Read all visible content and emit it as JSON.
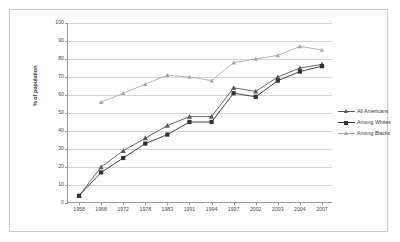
{
  "chart_data": {
    "type": "line",
    "title": "",
    "xlabel": "",
    "ylabel": "% of population",
    "ylim": [
      0,
      100
    ],
    "ytick_values": [
      0,
      10,
      20,
      30,
      40,
      50,
      60,
      70,
      80,
      90,
      100
    ],
    "grid": true,
    "legend_position": "right",
    "categories": [
      "1958",
      "1968",
      "1972",
      "1978",
      "1983",
      "1991",
      "1994",
      "1997",
      "2002",
      "2003",
      "2004",
      "2007"
    ],
    "series": [
      {
        "name": "All Americans",
        "marker": "triangle",
        "color": "#595959",
        "values": [
          4,
          20,
          29,
          36,
          43,
          48,
          48,
          64,
          62,
          70,
          75,
          77
        ]
      },
      {
        "name": "Among Whites",
        "marker": "square",
        "color": "#333333",
        "values": [
          4,
          17,
          25,
          33,
          38,
          45,
          45,
          61,
          59,
          68,
          73,
          76
        ]
      },
      {
        "name": "Among Blacks",
        "marker": "triangle-small",
        "color": "#a6a6a6",
        "values": [
          null,
          56,
          61,
          66,
          71,
          70,
          68,
          78,
          80,
          82,
          87,
          85
        ]
      }
    ]
  }
}
